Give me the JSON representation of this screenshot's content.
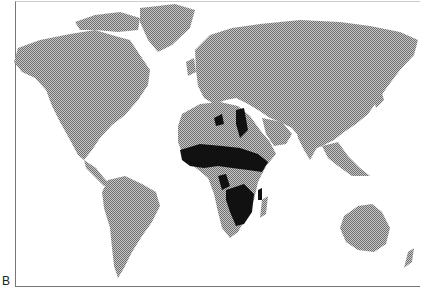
{
  "figure": {
    "panel_label": "B",
    "map_type": "world distribution map",
    "land_color": "#9a9a9a",
    "highlight_color": "#111111",
    "highlighted_region": "Sub-Saharan and North Africa (distribution range)"
  }
}
